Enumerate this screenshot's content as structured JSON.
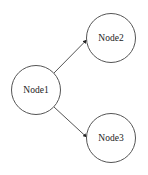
{
  "diagram": {
    "type": "directed-graph",
    "canvas": {
      "width": 148,
      "height": 175,
      "background": "#ffffff"
    },
    "colors": {
      "stroke": "#555555",
      "text": "#222222",
      "node_fill": "#ffffff"
    },
    "nodes": [
      {
        "id": "Node1",
        "label": "Node1",
        "cx": 36,
        "cy": 90,
        "r": 24.5
      },
      {
        "id": "Node2",
        "label": "Node2",
        "cx": 111,
        "cy": 38,
        "r": 24.5
      },
      {
        "id": "Node3",
        "label": "Node3",
        "cx": 111,
        "cy": 138,
        "r": 24.5
      }
    ],
    "edges": [
      {
        "from": "Node1",
        "to": "Node2",
        "x1": 54,
        "y1": 73,
        "x2": 86.5,
        "y2": 40
      },
      {
        "from": "Node1",
        "to": "Node3",
        "x1": 54,
        "y1": 107,
        "x2": 86.5,
        "y2": 137
      }
    ]
  }
}
